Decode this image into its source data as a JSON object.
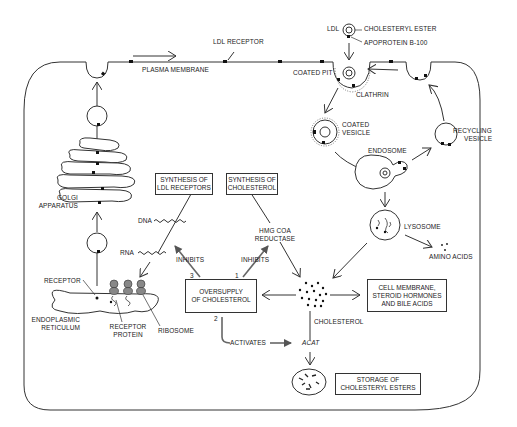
{
  "diagram": {
    "colors": {
      "line": "#333333",
      "background": "#ffffff",
      "receptor": "#111111"
    },
    "labels": {
      "ldl": "LDL",
      "cholesteryl_ester": "CHOLESTERYL ESTER",
      "apoprotein": "APOPROTEIN B-100",
      "ldl_receptor": "LDL RECEPTOR",
      "plasma_membrane": "PLASMA MEMBRANE",
      "coated_pit": "COATED PIT",
      "clathrin": "CLATHRIN",
      "coated_vesicle_1": "COATED",
      "coated_vesicle_2": "VESICLE",
      "recycling_vesicle_1": "RECYCLING",
      "recycling_vesicle_2": "VESICLE",
      "endosome": "ENDOSOME",
      "lysosome": "LYSOSOME",
      "amino_acids": "AMINO ACIDS",
      "golgi_1": "GOLGI",
      "golgi_2": "APPARATUS",
      "dna": "DNA",
      "rna": "RNA",
      "inhibits_left": "INHIBITS",
      "inhibits_right": "INHIBITS",
      "hmg_1": "HMG CoA",
      "hmg_2": "REDUCTASE",
      "num_3": "3",
      "num_1": "1",
      "num_2": "2",
      "receptor": "RECEPTOR",
      "er_1": "ENDOPLASMIC",
      "er_2": "RETICULUM",
      "receptor_protein_1": "RECEPTOR",
      "receptor_protein_2": "PROTEIN",
      "ribosome": "RIBOSOME",
      "cholesterol": "CHOLESTEROL",
      "activates": "ACTIVATES",
      "acat": "ACAT"
    },
    "boxes": {
      "synthesis_ldl_receptors": [
        "SYNTHESIS OF",
        "LDL RECEPTORS"
      ],
      "synthesis_cholesterol": [
        "SYNTHESIS OF",
        "CHOLESTEROL"
      ],
      "oversupply": [
        "OVERSUPPLY",
        "OF CHOLESTEROL"
      ],
      "cell_membrane": [
        "CELL MEMBRANE,",
        "STEROID HORMONES",
        "AND BILE ACIDS"
      ],
      "storage": [
        "STORAGE OF",
        "CHOLESTERYL ESTERS"
      ]
    }
  }
}
